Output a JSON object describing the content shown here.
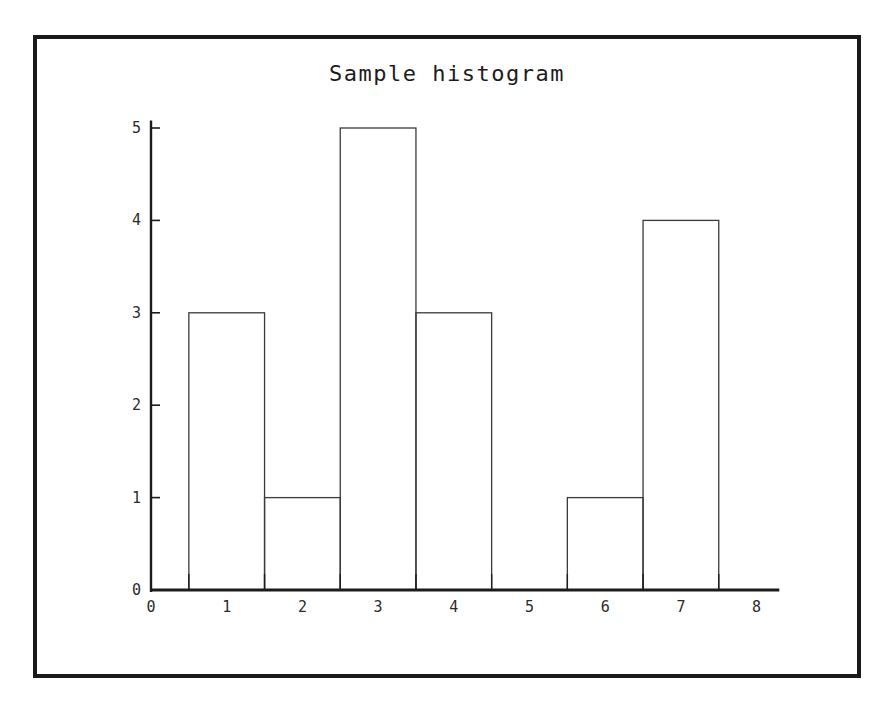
{
  "figure": {
    "background_color": "#ffffff",
    "frame_color": "#1a1a1a",
    "axis_color": "#1c1c1c",
    "bar_edge_color": "#3a3a3a"
  },
  "chart_data": {
    "type": "bar",
    "title": "Sample histogram",
    "xlabel": "",
    "ylabel": "",
    "categories": [
      "1",
      "2",
      "3",
      "4",
      "5",
      "6",
      "7",
      "8"
    ],
    "values": [
      3,
      1,
      5,
      3,
      0,
      1,
      4,
      0
    ],
    "bin_edges": [
      0.5,
      1.5,
      2.5,
      3.5,
      4.5,
      5.5,
      6.5,
      7.5,
      8.5
    ],
    "bar_style": "outline",
    "xlim": [
      0,
      8.3
    ],
    "ylim": [
      0,
      5
    ],
    "xticks": [
      0,
      1,
      2,
      3,
      4,
      5,
      6,
      7,
      8
    ],
    "xtick_labels": [
      "0",
      "1",
      "2",
      "3",
      "4",
      "5",
      "6",
      "7",
      "8"
    ],
    "xtick_mark_positions": [
      0.5,
      1.5,
      2.5,
      3.5,
      4.5,
      5.5,
      6.5,
      7.5
    ],
    "yticks": [
      0,
      1,
      2,
      3,
      4,
      5
    ],
    "ytick_labels": [
      "0",
      "1",
      "2",
      "3",
      "4",
      "5"
    ],
    "grid": false,
    "legend": null
  }
}
